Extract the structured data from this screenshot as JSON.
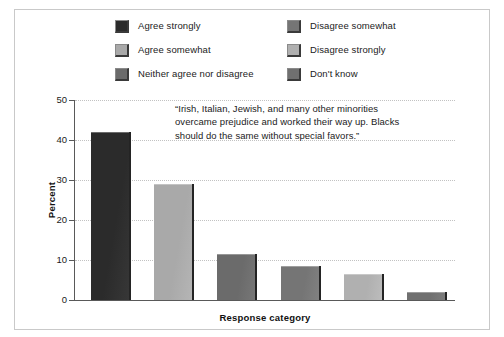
{
  "figure": {
    "legend": {
      "columns": [
        {
          "items": [
            {
              "label": "Agree strongly",
              "color": "#2b2b2b"
            },
            {
              "label": "Agree somewhat",
              "color": "#a9a9a9"
            },
            {
              "label": "Neither agree nor disagree",
              "color": "#6b6b6b"
            }
          ]
        },
        {
          "items": [
            {
              "label": "Disagree somewhat",
              "color": "#757575"
            },
            {
              "label": "Disagree strongly",
              "color": "#b0b0b0"
            },
            {
              "label": "Don't know",
              "color": "#707070"
            }
          ]
        }
      ]
    },
    "annotation": "“Irish, Italian, Jewish, and many other minorities overcame prejudice and worked their way up. Blacks should do the same without special favors.”"
  },
  "chart_data": {
    "type": "bar",
    "title": "",
    "xlabel": "Response category",
    "ylabel": "Percent",
    "ylim": [
      0,
      50
    ],
    "yticks": [
      0,
      10,
      20,
      30,
      40,
      50
    ],
    "grid": true,
    "legend_position": "top",
    "categories": [
      "Agree strongly",
      "Agree somewhat",
      "Neither agree nor disagree",
      "Disagree somewhat",
      "Disagree strongly",
      "Don't know"
    ],
    "values": [
      42.0,
      29.0,
      11.5,
      8.5,
      6.5,
      2.0
    ],
    "colors": [
      "#2b2b2b",
      "#a9a9a9",
      "#6b6b6b",
      "#757575",
      "#b0b0b0",
      "#707070"
    ]
  }
}
